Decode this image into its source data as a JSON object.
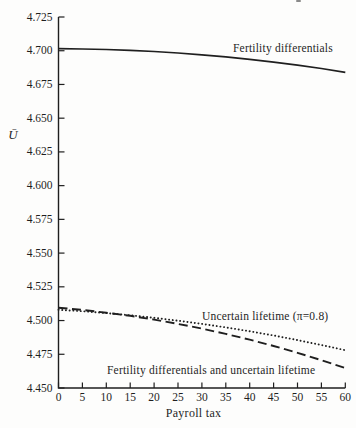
{
  "figure": {
    "background": "#fdfdfc",
    "ink": "#1f1f1f"
  },
  "chart_data": {
    "type": "line",
    "title": "",
    "xlabel": "Payroll tax",
    "ylabel": "Ū",
    "xlim": [
      0,
      60
    ],
    "ylim": [
      4.45,
      4.725
    ],
    "grid": false,
    "legend_position": "inline-annotations",
    "x_tick_labels": [
      "0",
      "5",
      "10",
      "15",
      "20",
      "25",
      "30",
      "35",
      "40",
      "45",
      "50",
      "55",
      "60"
    ],
    "y_tick_labels": [
      "4.725",
      "4.700",
      "4.675",
      "4.650",
      "4.625",
      "4.600",
      "4.575",
      "4.550",
      "4.525",
      "4.500",
      "4.475",
      "4.450"
    ],
    "x": [
      0,
      5,
      10,
      15,
      20,
      25,
      30,
      35,
      40,
      45,
      50,
      55,
      60
    ],
    "series": [
      {
        "name": "Fertility differentials",
        "style": "solid",
        "values": [
          4.7015,
          4.7013,
          4.7009,
          4.7003,
          4.6994,
          4.6983,
          4.697,
          4.6954,
          4.6936,
          4.6916,
          4.6893,
          4.6868,
          4.684
        ]
      },
      {
        "name": "Uncertain lifetime (π=0.8)",
        "style": "dotted",
        "values": [
          4.508,
          4.5069,
          4.5055,
          4.5039,
          4.502,
          4.4999,
          4.4975,
          4.4949,
          4.492,
          4.4889,
          4.4855,
          4.4819,
          4.478
        ]
      },
      {
        "name": "Fertility differentials and uncertain lifetime",
        "style": "dashed",
        "values": [
          4.5095,
          4.5079,
          4.5058,
          4.5035,
          4.5007,
          4.4975,
          4.494,
          4.4901,
          4.4858,
          4.4811,
          4.4761,
          4.4706,
          4.4648
        ]
      }
    ]
  }
}
